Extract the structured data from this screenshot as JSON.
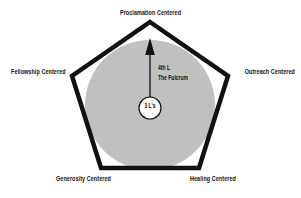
{
  "diagram": {
    "type": "pentagon-concept-diagram",
    "background_color": "#ffffff",
    "outline_color": "#111111",
    "fill_color": "#c0c0c0",
    "text_color": "#111111",
    "vertex_labels": [
      {
        "id": "proclamation",
        "text": "Proclamation Centered",
        "position": "top"
      },
      {
        "id": "fellowship",
        "text": "Fellowship Centered",
        "position": "left"
      },
      {
        "id": "outreach",
        "text": "Outreach Centered",
        "position": "right"
      },
      {
        "id": "generosity",
        "text": "Generosity Centered",
        "position": "bottom-left"
      },
      {
        "id": "healing",
        "text": "Healing Centered",
        "position": "bottom-right"
      }
    ],
    "annotation": {
      "line1": "4th L",
      "line2": "The Fulcrum"
    },
    "center_circle": {
      "label": "3 L's"
    }
  }
}
